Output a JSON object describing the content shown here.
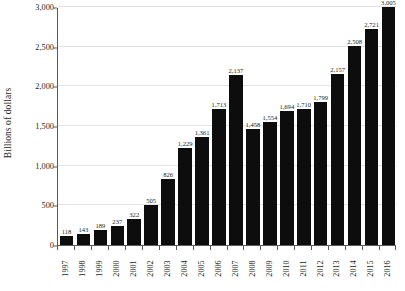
{
  "chart_data": {
    "type": "bar",
    "title": "",
    "subtitle": "",
    "xlabel": "",
    "ylabel": "Billions of dollars",
    "ylim": [
      0,
      3000
    ],
    "ytick_values": [
      0,
      500,
      1000,
      1500,
      2000,
      2500,
      3000
    ],
    "ytick_labels": [
      "0",
      "500",
      "1,000",
      "1,500",
      "2,000",
      "2,500",
      "3,000"
    ],
    "grid": true,
    "legend": false,
    "legend_position": "none",
    "bar_color": "#0d0d0d",
    "gridline_color": "#e3e3e4",
    "axis_color": "#58595b",
    "background_color": "#ffffff",
    "categories": [
      "1997",
      "1998",
      "1999",
      "2000",
      "2001",
      "2002",
      "2003",
      "2004",
      "2005",
      "2006",
      "2007",
      "2008",
      "2009",
      "2010",
      "2011",
      "2012",
      "2013",
      "2014",
      "2015",
      "2016"
    ],
    "values": [
      118,
      143,
      189,
      237,
      322,
      505,
      826,
      1229,
      1361,
      1713,
      2137,
      1458,
      1554,
      1694,
      1710,
      1799,
      2157,
      2508,
      2721,
      3005
    ],
    "value_labels": [
      "118",
      "143",
      "189",
      "237",
      "322",
      "505",
      "826",
      "1,229",
      "1,361",
      "1,713",
      "2,137",
      "1,458",
      "1,554",
      "1,694",
      "1,710",
      "1,799",
      "2,157",
      "2,508",
      "2,721",
      "3,005"
    ]
  }
}
